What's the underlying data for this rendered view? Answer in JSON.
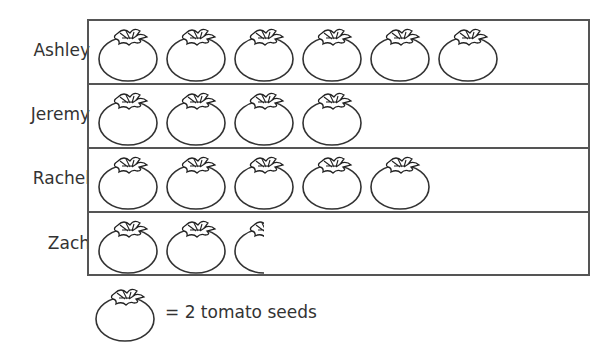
{
  "chart_data": {
    "type": "pictograph",
    "title": "Seeds Planted",
    "categories": [
      "Ashley",
      "Jeremy",
      "Rachel",
      "Zach"
    ],
    "symbols": [
      6,
      4,
      5,
      2.5
    ],
    "values": [
      12,
      8,
      10,
      5
    ],
    "unit_value": 2,
    "legend": "= 2 tomato seeds",
    "symbol": "tomato-icon"
  },
  "rows": [
    {
      "label": "Ashley",
      "count": 6
    },
    {
      "label": "Jeremy",
      "count": 4
    },
    {
      "label": "Rachel",
      "count": 5
    },
    {
      "label": "Zach",
      "count": 2.5
    }
  ],
  "legend": {
    "text": "= 2 tomato seeds"
  }
}
